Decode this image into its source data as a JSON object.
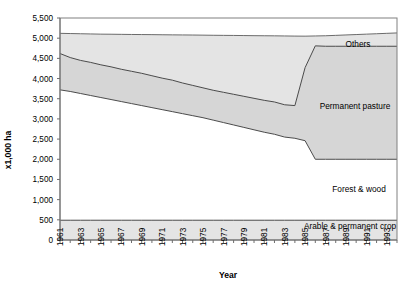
{
  "chart_data": {
    "type": "area",
    "stacked": true,
    "title": "",
    "xlabel": "Year",
    "ylabel": "x1,000 ha",
    "xlim": [
      1961,
      1994
    ],
    "ylim": [
      0,
      5500
    ],
    "ytick_step": 500,
    "grid": false,
    "legend_position": "inline-annotations",
    "x": [
      1961,
      1962,
      1963,
      1964,
      1965,
      1966,
      1967,
      1968,
      1969,
      1970,
      1971,
      1972,
      1973,
      1974,
      1975,
      1976,
      1977,
      1978,
      1979,
      1980,
      1981,
      1982,
      1983,
      1984,
      1985,
      1986,
      1987,
      1988,
      1989,
      1990,
      1991,
      1992,
      1993,
      1994
    ],
    "xticks": [
      "1961",
      "1963",
      "1965",
      "1967",
      "1969",
      "1971",
      "1973",
      "1975",
      "1977",
      "1979",
      "1981",
      "1983",
      "1985",
      "1987",
      "1989",
      "1991",
      "1993"
    ],
    "yticks": [
      "0",
      "500",
      "1,000",
      "1,500",
      "2,000",
      "2,500",
      "3,000",
      "3,500",
      "4,000",
      "4,500",
      "5,000",
      "5,500"
    ],
    "series": [
      {
        "name": "Arable & permanent crop",
        "values": [
          490,
          490,
          490,
          490,
          490,
          490,
          490,
          490,
          490,
          490,
          490,
          490,
          490,
          490,
          490,
          490,
          490,
          490,
          490,
          490,
          490,
          490,
          490,
          490,
          490,
          490,
          490,
          490,
          490,
          490,
          490,
          490,
          490,
          490
        ]
      },
      {
        "name": "Forest & wood",
        "values": [
          3230,
          3190,
          3140,
          3090,
          3040,
          2990,
          2940,
          2890,
          2840,
          2790,
          2740,
          2690,
          2640,
          2590,
          2540,
          2480,
          2420,
          2360,
          2300,
          2240,
          2180,
          2130,
          2060,
          2030,
          1970,
          1510,
          1510,
          1510,
          1510,
          1510,
          1510,
          1510,
          1510,
          1510
        ]
      },
      {
        "name": "Permanent pasture",
        "values": [
          900,
          840,
          820,
          810,
          800,
          800,
          790,
          790,
          790,
          780,
          770,
          770,
          750,
          740,
          730,
          730,
          740,
          750,
          760,
          770,
          780,
          790,
          790,
          800,
          1800,
          2800,
          2790,
          2790,
          2790,
          2790,
          2790,
          2790,
          2790,
          2790
        ]
      },
      {
        "name": "Others",
        "values": [
          500,
          540,
          570,
          590,
          610,
          620,
          640,
          650,
          660,
          680,
          690,
          700,
          710,
          720,
          740,
          760,
          780,
          790,
          800,
          810,
          820,
          830,
          850,
          860,
          880,
          890,
          900,
          910,
          930,
          940,
          950,
          960,
          980,
          990
        ]
      }
    ],
    "cumulative_boundaries": {
      "arable_top": [
        490,
        490,
        490,
        490,
        490,
        490,
        490,
        490,
        490,
        490,
        490,
        490,
        490,
        490,
        490,
        490,
        490,
        490,
        490,
        490,
        490,
        490,
        490,
        490,
        490,
        490,
        490,
        490,
        490,
        490,
        490,
        490,
        490,
        490
      ],
      "forest_top": [
        3720,
        3680,
        3630,
        3580,
        3530,
        3480,
        3430,
        3380,
        3330,
        3280,
        3230,
        3180,
        3130,
        3080,
        3030,
        2970,
        2910,
        2850,
        2790,
        2730,
        2670,
        2620,
        2550,
        2520,
        2460,
        2000,
        2000,
        2000,
        2000,
        2000,
        2000,
        2000,
        2000,
        2000
      ],
      "pasture_top": [
        4620,
        4520,
        4450,
        4390,
        4330,
        4280,
        4220,
        4170,
        4120,
        4060,
        4000,
        3950,
        3880,
        3820,
        3760,
        3700,
        3650,
        3600,
        3550,
        3500,
        3450,
        3410,
        3340,
        3320,
        4260,
        4800,
        4790,
        4790,
        4790,
        4790,
        4790,
        4790,
        4790,
        4790
      ],
      "others_top": [
        5120,
        5060,
        5020,
        4980,
        4940,
        4900,
        4860,
        4820,
        4780,
        4740,
        4690,
        4650,
        4590,
        4540,
        4500,
        4460,
        4430,
        4390,
        4350,
        4310,
        4270,
        4240,
        4190,
        4180,
        5140,
        5690,
        5690,
        5690,
        5720,
        5730,
        5740,
        5750,
        5770,
        5780
      ]
    },
    "boundary_pasture_top_plot": [
      4620,
      4520,
      4450,
      4400,
      4340,
      4290,
      4230,
      4180,
      4130,
      4070,
      4010,
      3960,
      3890,
      3830,
      3770,
      3710,
      3660,
      3610,
      3560,
      3510,
      3460,
      3420,
      3350,
      3330,
      4270,
      4810,
      4800,
      4800,
      4800,
      4800,
      4800,
      4800,
      4800,
      4800
    ]
  },
  "annotations": {
    "others": "Others",
    "permanent_pasture": "Permanent pasture",
    "forest_wood": "Forest & wood",
    "arable": "Arable & permanent crop"
  },
  "axes": {
    "x_title": "Year",
    "y_title": "x1,000 ha"
  },
  "colors": {
    "band_light": "#e3e3e3",
    "band_mid": "#d2d2d2",
    "band_white": "#ffffff",
    "line": "#4d4d4d",
    "frame": "#5a5a5a",
    "text": "#000000"
  }
}
